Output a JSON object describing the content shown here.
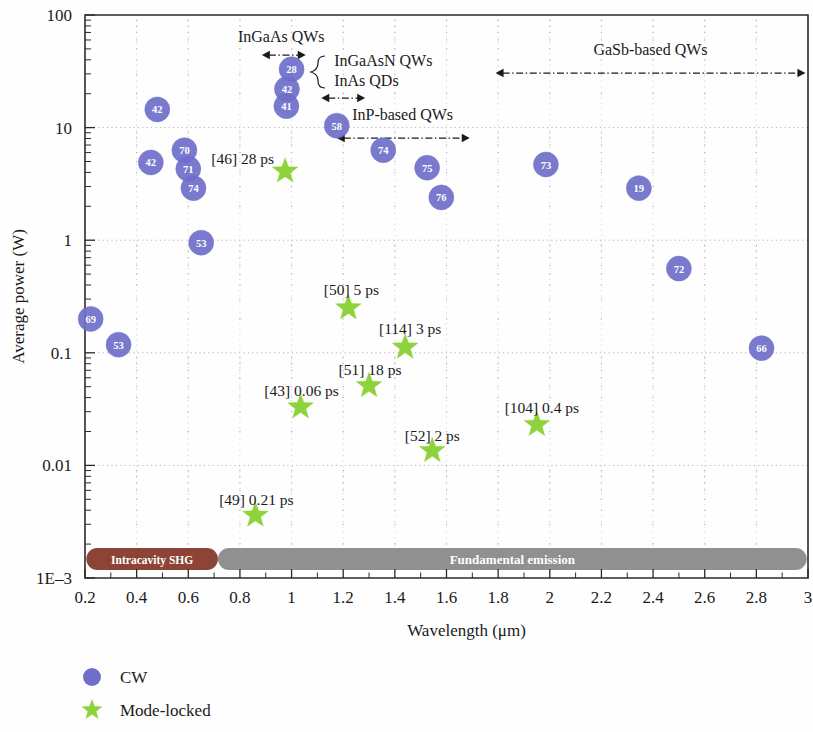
{
  "chart_data": {
    "type": "scatter",
    "title": "",
    "xlabel": "Wavelength (μm)",
    "ylabel": "Average power (W)",
    "xlim": [
      0.2,
      3.0
    ],
    "ylim": [
      0.001,
      100
    ],
    "yscale": "log",
    "xscale": "linear",
    "grid": true,
    "xticks": [
      "0.2",
      "0.4",
      "0.6",
      "0.8",
      "1",
      "1.2",
      "1.4",
      "1.6",
      "1.8",
      "2",
      "2.2",
      "2.4",
      "2.6",
      "2.8",
      "3"
    ],
    "xtick_values": [
      0.2,
      0.4,
      0.6,
      0.8,
      1.0,
      1.2,
      1.4,
      1.6,
      1.8,
      2.0,
      2.2,
      2.4,
      2.6,
      2.8,
      3.0
    ],
    "yticks": [
      "100",
      "10",
      "1",
      "0.1",
      "0.01",
      "1E–3"
    ],
    "ytick_values": [
      100,
      10,
      1,
      0.1,
      0.01,
      0.001
    ],
    "legend_position": "below-left",
    "series": [
      {
        "name": "CW",
        "marker": "circle",
        "color": "#6f6fcb",
        "points": [
          {
            "label": "69",
            "x": 0.222,
            "y": 0.2
          },
          {
            "label": "53",
            "x": 0.33,
            "y": 0.118
          },
          {
            "label": "42",
            "x": 0.48,
            "y": 14.5
          },
          {
            "label": "42",
            "x": 0.455,
            "y": 4.9
          },
          {
            "label": "70",
            "x": 0.585,
            "y": 6.3
          },
          {
            "label": "71",
            "x": 0.6,
            "y": 4.3
          },
          {
            "label": "74",
            "x": 0.62,
            "y": 2.9
          },
          {
            "label": "53",
            "x": 0.65,
            "y": 0.95
          },
          {
            "label": "28",
            "x": 1.0,
            "y": 33.0
          },
          {
            "label": "42",
            "x": 0.982,
            "y": 22.0
          },
          {
            "label": "41",
            "x": 0.98,
            "y": 15.5
          },
          {
            "label": "58",
            "x": 1.175,
            "y": 10.4
          },
          {
            "label": "74",
            "x": 1.355,
            "y": 6.3
          },
          {
            "label": "75",
            "x": 1.525,
            "y": 4.4
          },
          {
            "label": "76",
            "x": 1.58,
            "y": 2.4
          },
          {
            "label": "73",
            "x": 1.985,
            "y": 4.7
          },
          {
            "label": "19",
            "x": 2.345,
            "y": 2.9
          },
          {
            "label": "72",
            "x": 2.5,
            "y": 0.56
          },
          {
            "label": "66",
            "x": 2.82,
            "y": 0.11
          }
        ]
      },
      {
        "name": "Mode-locked",
        "marker": "star",
        "color": "#8fd33c",
        "points": [
          {
            "label": "[46] 28 ps",
            "ref": "[46]",
            "pulse": "28 ps",
            "x": 0.975,
            "y": 4.1,
            "label_anchor": "end"
          },
          {
            "label": "[50] 5 ps",
            "ref": "[50]",
            "pulse": "5 ps",
            "x": 1.22,
            "y": 0.25,
            "label_anchor": "center"
          },
          {
            "label": "[114] 3 ps",
            "ref": "[114]",
            "pulse": "3 ps",
            "x": 1.44,
            "y": 0.112,
            "label_anchor": "center"
          },
          {
            "label": "[51] 18 ps",
            "ref": "[51]",
            "pulse": "18 ps",
            "x": 1.3,
            "y": 0.051,
            "label_anchor": "center"
          },
          {
            "label": "[43] 0.06 ps",
            "ref": "[43]",
            "pulse": "0.06 ps",
            "x": 1.035,
            "y": 0.033,
            "label_anchor": "center"
          },
          {
            "label": "[52] 2 ps",
            "ref": "[52]",
            "pulse": "2 ps",
            "x": 1.545,
            "y": 0.0135,
            "label_anchor": "center"
          },
          {
            "label": "[104] 0.4 ps",
            "ref": "[104]",
            "pulse": "0.4 ps",
            "x": 1.95,
            "y": 0.023,
            "label_anchor": "center"
          },
          {
            "label": "[49] 0.21 ps",
            "ref": "[49]",
            "pulse": "0.21 ps",
            "x": 0.86,
            "y": 0.0036,
            "label_anchor": "center"
          }
        ]
      }
    ],
    "annotations": [
      {
        "name": "ingaas-qws",
        "text": "InGaAs QWs",
        "x_start": 0.885,
        "x_end": 1.055,
        "text_x": 0.96,
        "text_y_px": 42,
        "arrow_y_px": 55,
        "arrow": "double"
      },
      {
        "name": "ingaasn-qws",
        "text": "InGaAsN QWs",
        "text_x": 1.165,
        "text_y_px": 66,
        "arrow": "none"
      },
      {
        "name": "inas-qds",
        "text": "InAs QDs",
        "text_x": 1.165,
        "text_y_px": 86,
        "arrow": "none"
      },
      {
        "name": "ingaasn-inas-range",
        "text": "",
        "x_start": 1.115,
        "x_end": 1.285,
        "arrow_y_px": 98,
        "arrow": "double"
      },
      {
        "name": "inp-based-qws",
        "text": "InP-based QWs",
        "x_start": 1.175,
        "x_end": 1.69,
        "text_x": 1.43,
        "text_y_px": 120,
        "arrow_y_px": 138,
        "arrow": "double"
      },
      {
        "name": "gasb-based-qws",
        "text": "GaSb-based QWs",
        "x_start": 1.79,
        "x_end": 2.99,
        "text_x": 2.39,
        "text_y_px": 55,
        "arrow_y_px": 73,
        "arrow": "double"
      }
    ],
    "bands": [
      {
        "name": "intracavity-shg",
        "text": "Intracavity SHG",
        "x_start": 0.205,
        "x_end": 0.715,
        "color": "#8d4436"
      },
      {
        "name": "fundamental-emission",
        "text": "Fundamental emission",
        "x_start": 0.715,
        "x_end": 2.995,
        "color": "#909090"
      }
    ]
  },
  "legend": {
    "items": [
      {
        "label": "CW",
        "marker": "circle",
        "color": "#6f6fcb"
      },
      {
        "label": "Mode-locked",
        "marker": "star",
        "color": "#8fd33c"
      }
    ]
  }
}
